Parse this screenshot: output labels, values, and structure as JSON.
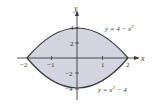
{
  "diagram": {
    "type": "region-between-curves",
    "curves": [
      {
        "label": "y = 4 − x²",
        "equation": "y = 4 - x^2"
      },
      {
        "label": "y = x² − 4",
        "equation": "y = x^2 - 4"
      }
    ],
    "axes": {
      "x_label": "x",
      "y_label": "y",
      "x_ticks": [
        "−2",
        "−1",
        "1",
        "2"
      ],
      "y_ticks": [
        "4",
        "2",
        "−2",
        "−4"
      ]
    },
    "colors": {
      "fill": "#d4d3e0",
      "curve": "#3a3a3a",
      "axis": "#3a3a3a"
    }
  },
  "labels": {
    "top_curve": "y = 4 − x",
    "top_exp": "2",
    "bottom_curve": "y = x",
    "bottom_tail": " − 4",
    "bottom_exp": "2",
    "x_axis": "x",
    "y_axis": "y",
    "tick_m2": "−2",
    "tick_m1": "−1",
    "tick_1": "1",
    "tick_2": "2",
    "tick_y4": "4",
    "tick_y2": "2",
    "tick_ym2": "−2",
    "tick_ym4": "−4"
  }
}
